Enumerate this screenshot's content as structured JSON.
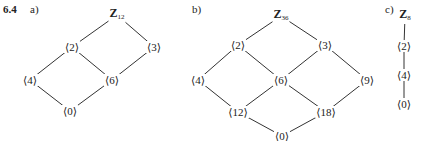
{
  "problem_number": "6.4",
  "parts": [
    {
      "label": "a)",
      "nodes": [
        {
          "id": "Z12",
          "group": "Z",
          "sub": "12",
          "x": 117,
          "y": 15
        },
        {
          "id": "g2",
          "text": "⟨2⟩",
          "x": 72,
          "y": 47
        },
        {
          "id": "g3",
          "text": "⟨3⟩",
          "x": 154,
          "y": 47
        },
        {
          "id": "g4",
          "text": "⟨4⟩",
          "x": 30,
          "y": 80
        },
        {
          "id": "g6",
          "text": "⟨6⟩",
          "x": 112,
          "y": 80
        },
        {
          "id": "g0",
          "text": "⟨0⟩",
          "x": 70,
          "y": 111
        }
      ],
      "edges": [
        [
          "Z12",
          "g2"
        ],
        [
          "Z12",
          "g3"
        ],
        [
          "g2",
          "g4"
        ],
        [
          "g2",
          "g6"
        ],
        [
          "g3",
          "g6"
        ],
        [
          "g4",
          "g0"
        ],
        [
          "g6",
          "g0"
        ]
      ]
    },
    {
      "label": "b)",
      "nodes": [
        {
          "id": "Z36",
          "group": "Z",
          "sub": "36",
          "x": 281,
          "y": 16
        },
        {
          "id": "g2",
          "text": "⟨2⟩",
          "x": 238,
          "y": 45
        },
        {
          "id": "g3",
          "text": "⟨3⟩",
          "x": 325,
          "y": 45
        },
        {
          "id": "g4",
          "text": "⟨4⟩",
          "x": 198,
          "y": 80
        },
        {
          "id": "g6",
          "text": "⟨6⟩",
          "x": 281,
          "y": 80
        },
        {
          "id": "g9",
          "text": "⟨9⟩",
          "x": 367,
          "y": 80
        },
        {
          "id": "g12",
          "text": "⟨12⟩",
          "x": 238,
          "y": 112
        },
        {
          "id": "g18",
          "text": "⟨18⟩",
          "x": 326,
          "y": 112
        },
        {
          "id": "g0",
          "text": "⟨0⟩",
          "x": 282,
          "y": 136
        }
      ],
      "edges": [
        [
          "Z36",
          "g2"
        ],
        [
          "Z36",
          "g3"
        ],
        [
          "g2",
          "g4"
        ],
        [
          "g2",
          "g6"
        ],
        [
          "g3",
          "g6"
        ],
        [
          "g3",
          "g9"
        ],
        [
          "g4",
          "g12"
        ],
        [
          "g6",
          "g12"
        ],
        [
          "g6",
          "g18"
        ],
        [
          "g9",
          "g18"
        ],
        [
          "g12",
          "g0"
        ],
        [
          "g18",
          "g0"
        ]
      ]
    },
    {
      "label": "c)",
      "nodes": [
        {
          "id": "Z8",
          "group": "Z",
          "sub": "8",
          "x": 405,
          "y": 16
        },
        {
          "id": "g2",
          "text": "⟨2⟩",
          "x": 404,
          "y": 46
        },
        {
          "id": "g4",
          "text": "⟨4⟩",
          "x": 404,
          "y": 75
        },
        {
          "id": "g0",
          "text": "⟨0⟩",
          "x": 404,
          "y": 104
        }
      ],
      "edges": [
        [
          "Z8",
          "g2"
        ],
        [
          "g2",
          "g4"
        ],
        [
          "g4",
          "g0"
        ]
      ]
    }
  ],
  "label_positions": [
    {
      "x": 3,
      "y": 3
    },
    {
      "x": 192,
      "y": 3
    },
    {
      "x": 385,
      "y": 3
    }
  ],
  "colors": {
    "line": "#333333",
    "text": "#222222"
  }
}
